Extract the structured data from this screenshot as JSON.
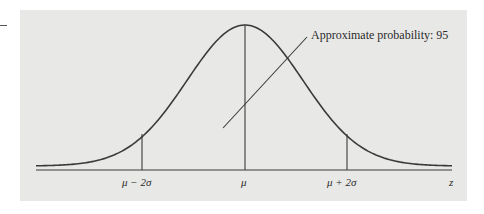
{
  "diagram": {
    "annotation": "Approximate probability: 95",
    "tick_labels": {
      "minus_2sigma": "μ − 2σ",
      "mean": "μ",
      "plus_2sigma": "μ + 2σ",
      "axis_end": "z"
    },
    "colors": {
      "panel_background": "#e8e8e6",
      "line": "#3a3a3a",
      "text": "#2b2b2b"
    }
  },
  "chart_data": {
    "type": "line",
    "xlabel": "z",
    "ylabel": "",
    "x_ticks": [
      "μ − 2σ",
      "μ",
      "μ + 2σ"
    ],
    "vertical_markers": [
      "μ − 2σ",
      "μ",
      "μ + 2σ"
    ],
    "annotation": "Approximate probability: 95",
    "series": [
      {
        "name": "normal density",
        "x_sigma": [
          -3.4,
          -3,
          -2.5,
          -2,
          -1.5,
          -1,
          -0.5,
          0,
          0.5,
          1,
          1.5,
          2,
          2.5,
          3,
          3.4
        ],
        "values": [
          0.001,
          0.004,
          0.018,
          0.054,
          0.13,
          0.242,
          0.352,
          0.399,
          0.352,
          0.242,
          0.13,
          0.054,
          0.018,
          0.004,
          0.001
        ]
      }
    ],
    "grid": false
  }
}
